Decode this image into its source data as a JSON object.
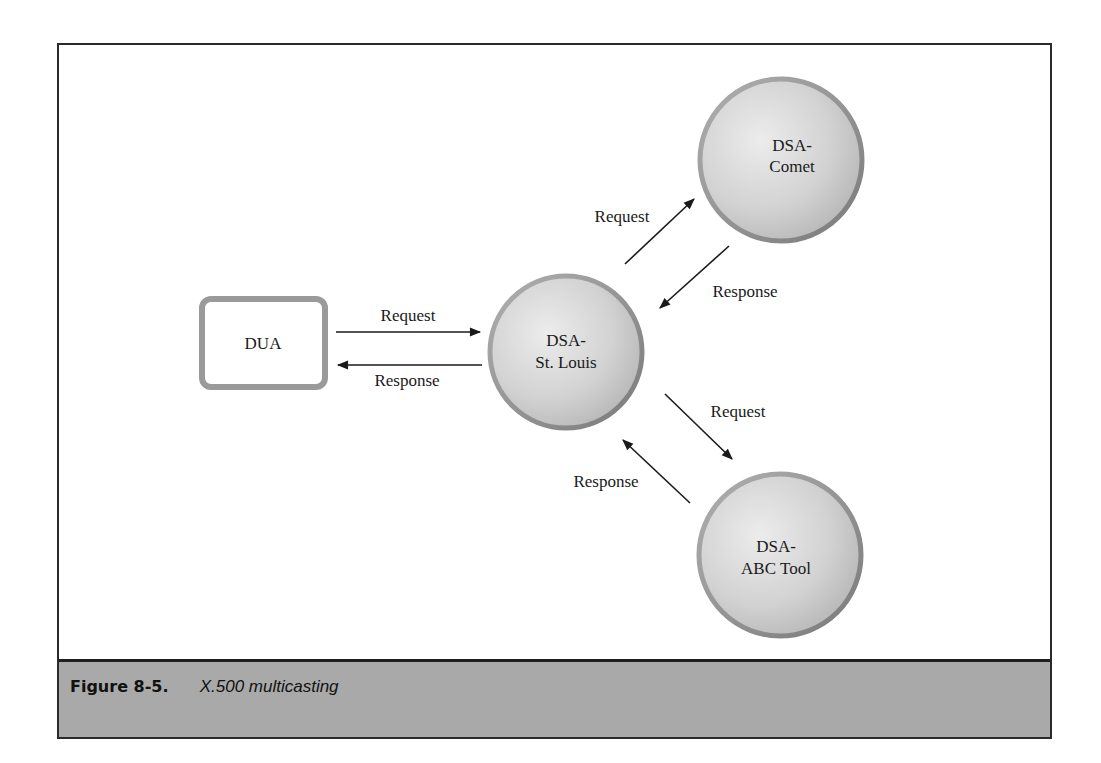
{
  "figure": {
    "label": "Figure 8-5.",
    "title": "X.500 multicasting"
  },
  "nodes": {
    "dua": {
      "label": "DUA"
    },
    "st_louis": {
      "line1": "DSA-",
      "line2": "St. Louis"
    },
    "comet": {
      "line1": "DSA-",
      "line2": "Comet"
    },
    "abc_tool": {
      "line1": "DSA-",
      "line2": "ABC Tool"
    }
  },
  "edges": {
    "dua_to_stlouis": "Request",
    "stlouis_to_dua": "Response",
    "stlouis_to_comet": "Request",
    "comet_to_stlouis": "Response",
    "stlouis_to_abc": "Request",
    "abc_to_stlouis": "Response"
  },
  "colors": {
    "frame": "#2a2a2a",
    "caption_bg": "#a9a9a9",
    "node_fill": "#d4d4d4",
    "node_rim": "#8a8a8a"
  }
}
